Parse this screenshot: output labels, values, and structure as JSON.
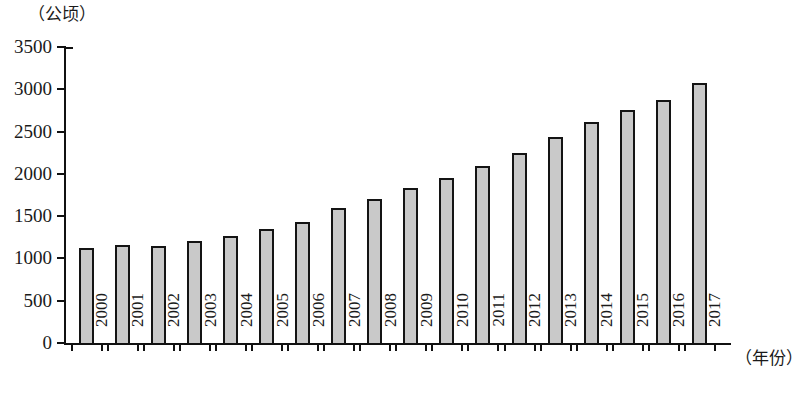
{
  "chart_data": {
    "type": "bar",
    "title": "",
    "subtitle": "",
    "xlabel": "（年份）",
    "ylabel": "（公顷）",
    "categories": [
      "2000",
      "2001",
      "2002",
      "2003",
      "2004",
      "2005",
      "2006",
      "2007",
      "2008",
      "2009",
      "2010",
      "2011",
      "2012",
      "2013",
      "2014",
      "2015",
      "2016",
      "2017"
    ],
    "values": [
      1120,
      1160,
      1150,
      1210,
      1265,
      1350,
      1425,
      1600,
      1705,
      1830,
      1950,
      2090,
      2250,
      2440,
      2610,
      2760,
      2870,
      3080
    ],
    "ylim": [
      0,
      3500
    ],
    "ytick_labels": [
      "0",
      "500",
      "1000",
      "1500",
      "2000",
      "2500",
      "3000",
      "3500"
    ],
    "ytick_values": [
      0,
      500,
      1000,
      1500,
      2000,
      2500,
      3000,
      3500
    ],
    "grid": false,
    "legend": null,
    "legend_position": "none",
    "bar_fill_color": "#c9c9c9",
    "bar_edge_color": "#141414",
    "axis_color": "#111111",
    "background_color": "#ffffff"
  }
}
